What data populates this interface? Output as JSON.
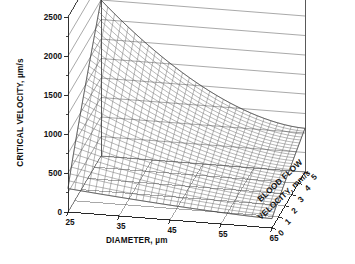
{
  "chart_data": {
    "type": "surface",
    "title": "",
    "xlabel": "DIAMETER, µm",
    "ylabel": "BLOOD FLOW VELOCITY, mm/s",
    "zlabel": "CRITICAL VELOCITY, µm/s",
    "xlim": [
      25,
      65
    ],
    "ylim": [
      0,
      5
    ],
    "zlim": [
      0,
      2500
    ],
    "xticks": [
      "25",
      "35",
      "45",
      "55",
      "65"
    ],
    "xtick_values": [
      25,
      35,
      45,
      55,
      65
    ],
    "yticks": [
      "0",
      "1",
      "2",
      "3",
      "4",
      "5"
    ],
    "ytick_values": [
      0,
      1,
      2,
      3,
      4,
      5
    ],
    "zticks": [
      "0",
      "500",
      "1000",
      "1500",
      "2000",
      "2500"
    ],
    "ztick_values": [
      0,
      500,
      1000,
      1500,
      2000,
      2500
    ],
    "zminor_step": 250,
    "grid": true,
    "legend": null,
    "mesh_nx": 31,
    "mesh_ny": 31,
    "line_color": "#555555",
    "axis_color": "#1a1a1a",
    "background": "#ffffff",
    "corner_values": {
      "x25_y0": 300,
      "x25_y5": 2000,
      "x65_y0": 120,
      "x65_y5": 560
    }
  },
  "axes": {
    "z_label": "CRITICAL VELOCITY, µm/s",
    "x_label": "DIAMETER, µm",
    "y_label_line1": "BLOOD FLOW",
    "y_label_line2": "VELOCITY, mm/s"
  }
}
